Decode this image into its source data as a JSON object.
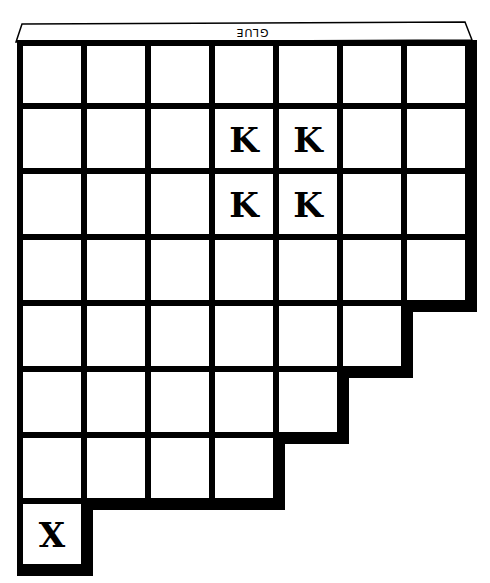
{
  "puzzle": {
    "tab_label": "GLUE",
    "columns": 7,
    "row_lengths": [
      7,
      7,
      7,
      7,
      6,
      5,
      4,
      1
    ],
    "geometry": {
      "col_lines": [
        20,
        84,
        148,
        212,
        276,
        340,
        404,
        468
      ],
      "row_lines": [
        43,
        106,
        171,
        237,
        303,
        369,
        435,
        501,
        567
      ],
      "line_width": 6,
      "shadow_width": 8
    },
    "marks": [
      {
        "row": 1,
        "col": 3,
        "letter": "K"
      },
      {
        "row": 1,
        "col": 4,
        "letter": "K"
      },
      {
        "row": 2,
        "col": 3,
        "letter": "K"
      },
      {
        "row": 2,
        "col": 4,
        "letter": "K"
      },
      {
        "row": 7,
        "col": 0,
        "letter": "X"
      }
    ],
    "colors": {
      "line": "#000000",
      "cell": "#ffffff"
    }
  }
}
